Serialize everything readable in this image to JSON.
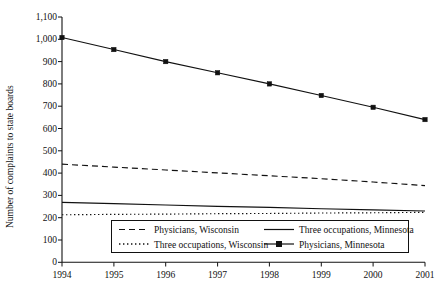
{
  "chart_data": {
    "type": "line",
    "title": "",
    "xlabel": "",
    "ylabel": "Number of complaints to state boards",
    "x": [
      1994,
      1995,
      1996,
      1997,
      1998,
      1999,
      2000,
      2001
    ],
    "xtick_labels": [
      "1994",
      "1995",
      "1996",
      "1997",
      "1998",
      "1999",
      "2000",
      "2001"
    ],
    "ytick_labels": [
      "0",
      "100",
      "200",
      "300",
      "400",
      "500",
      "600",
      "700",
      "800",
      "900",
      "1,000",
      "1,100"
    ],
    "ytick_values": [
      0,
      100,
      200,
      300,
      400,
      500,
      600,
      700,
      800,
      900,
      1000,
      1100
    ],
    "ylim": [
      0,
      1100
    ],
    "xlim": [
      1994,
      2001
    ],
    "grid": false,
    "legend_position": "lower-center-inside",
    "series": [
      {
        "name": "Physicians, Wisconsin",
        "style": "dashed",
        "marker": "none",
        "color": "#111111",
        "values": [
          440,
          427,
          414,
          401,
          388,
          375,
          360,
          344
        ]
      },
      {
        "name": "Three occupations, Wisconsin",
        "style": "dotted",
        "marker": "none",
        "color": "#111111",
        "values": [
          213,
          215,
          216,
          218,
          219,
          221,
          222,
          224
        ]
      },
      {
        "name": "Three occupations, Minnesota",
        "style": "solid",
        "marker": "none",
        "color": "#111111",
        "values": [
          269,
          263,
          257,
          251,
          246,
          240,
          235,
          230
        ]
      },
      {
        "name": "Physicians, Minnesota",
        "style": "solid",
        "marker": "square",
        "color": "#111111",
        "values": [
          1008,
          954,
          900,
          850,
          800,
          748,
          695,
          640
        ]
      }
    ]
  },
  "legend": {
    "entries": [
      {
        "label": "Physicians, Wisconsin",
        "style": "dashed",
        "marker": "none"
      },
      {
        "label": "Three occupations, Minnesota",
        "style": "solid",
        "marker": "none"
      },
      {
        "label": "Three occupations, Wisconsin",
        "style": "dotted",
        "marker": "none"
      },
      {
        "label": "Physicians, Minnesota",
        "style": "solid",
        "marker": "square"
      }
    ]
  },
  "axes": {
    "y_title": "Number of complaints to state boards"
  }
}
